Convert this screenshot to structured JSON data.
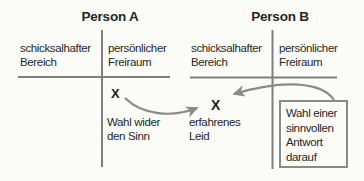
{
  "background_color": "#fbfbf8",
  "colors": {
    "axis_line": "#7f7f7f",
    "arrow": "#8a8a8a",
    "text": "#262626",
    "box_border": "#8a8a8a"
  },
  "person_a": {
    "title": "Person A",
    "fate_label": "schicksalhafter Bereich",
    "freedom_label": "persönlicher Freiraum",
    "x_mark": "X",
    "caption": "Wahl wider den Sinn"
  },
  "person_b": {
    "title": "Person B",
    "fate_label": "schicksalhafter Bereich",
    "freedom_label": "persönlicher Freiraum",
    "x_mark": "X",
    "caption": "erfahrenes Leid",
    "box_label": "Wahl einer sinnvollen Antwort darauf"
  }
}
